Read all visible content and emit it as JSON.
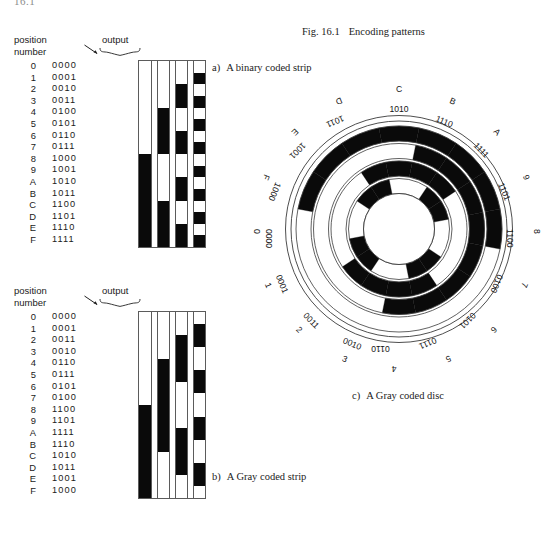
{
  "running_head": "16.1",
  "figure": {
    "number": "Fig. 16.1",
    "title": "Encoding patterns"
  },
  "binary_strip": {
    "header": {
      "position_label_line1": "position",
      "position_label_line2": "number",
      "output_label": "output"
    },
    "caption_label": "a)",
    "caption_text": "A binary coded strip",
    "rows": [
      {
        "index": "0",
        "code": "0000"
      },
      {
        "index": "1",
        "code": "0001"
      },
      {
        "index": "2",
        "code": "0010"
      },
      {
        "index": "3",
        "code": "0011"
      },
      {
        "index": "4",
        "code": "0100"
      },
      {
        "index": "5",
        "code": "0101"
      },
      {
        "index": "6",
        "code": "0110"
      },
      {
        "index": "7",
        "code": "0111"
      },
      {
        "index": "8",
        "code": "1000"
      },
      {
        "index": "9",
        "code": "1001"
      },
      {
        "index": "A",
        "code": "1010"
      },
      {
        "index": "B",
        "code": "1011"
      },
      {
        "index": "C",
        "code": "1100"
      },
      {
        "index": "D",
        "code": "1101"
      },
      {
        "index": "E",
        "code": "1110"
      },
      {
        "index": "F",
        "code": "1111"
      }
    ]
  },
  "gray_strip": {
    "header": {
      "position_label_line1": "position",
      "position_label_line2": "number",
      "output_label": "output"
    },
    "caption_label": "b)",
    "caption_text": "A Gray coded strip",
    "rows": [
      {
        "index": "0",
        "code": "0000"
      },
      {
        "index": "1",
        "code": "0001"
      },
      {
        "index": "2",
        "code": "0011"
      },
      {
        "index": "3",
        "code": "0010"
      },
      {
        "index": "4",
        "code": "0110"
      },
      {
        "index": "5",
        "code": "0111"
      },
      {
        "index": "6",
        "code": "0101"
      },
      {
        "index": "7",
        "code": "0100"
      },
      {
        "index": "8",
        "code": "1100"
      },
      {
        "index": "9",
        "code": "1101"
      },
      {
        "index": "A",
        "code": "1111"
      },
      {
        "index": "B",
        "code": "1110"
      },
      {
        "index": "C",
        "code": "1010"
      },
      {
        "index": "D",
        "code": "1011"
      },
      {
        "index": "E",
        "code": "1001"
      },
      {
        "index": "F",
        "code": "1000"
      }
    ]
  },
  "gray_disc": {
    "caption_label": "c)",
    "caption_text": "A Gray coded disc",
    "sectors": [
      {
        "index": "0",
        "code": "0000"
      },
      {
        "index": "1",
        "code": "0001"
      },
      {
        "index": "2",
        "code": "0011"
      },
      {
        "index": "3",
        "code": "0010"
      },
      {
        "index": "4",
        "code": "0110"
      },
      {
        "index": "5",
        "code": "0111"
      },
      {
        "index": "6",
        "code": "0101"
      },
      {
        "index": "7",
        "code": "0100"
      },
      {
        "index": "8",
        "code": "1100"
      },
      {
        "index": "9",
        "code": "1101"
      },
      {
        "index": "A",
        "code": "1111"
      },
      {
        "index": "B",
        "code": "1110"
      },
      {
        "index": "C",
        "code": "1010"
      },
      {
        "index": "D",
        "code": "1011"
      },
      {
        "index": "E",
        "code": "1001"
      },
      {
        "index": "F",
        "code": "1000"
      }
    ]
  },
  "colors": {
    "ink": "#0a0a0a",
    "paper": "#ffffff",
    "rule": "#5b5b5b"
  }
}
